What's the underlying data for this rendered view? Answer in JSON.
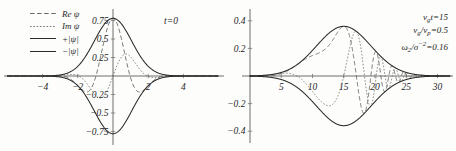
{
  "figure": {
    "background": "#fdfdfc",
    "ink": "#2a2a2a"
  },
  "legend": {
    "items": [
      {
        "label": "Re ψ",
        "style": "long-dash",
        "name": "legend-re-psi"
      },
      {
        "label": "Im ψ",
        "style": "short-dash",
        "name": "legend-im-psi"
      },
      {
        "label": "+|ψ|",
        "style": "solid",
        "name": "legend-plus-abs-psi"
      },
      {
        "label": "−|ψ|",
        "style": "solid",
        "name": "legend-minus-abs-psi"
      }
    ]
  },
  "chart_data": [
    {
      "type": "line",
      "panel": "left",
      "title": "t=0",
      "annotation": "t=0",
      "xlabel": "",
      "ylabel": "",
      "xlim": [
        -5.6,
        5.6
      ],
      "ylim": [
        -0.88,
        0.88
      ],
      "xticks": [
        -4,
        -2,
        2,
        4
      ],
      "xticklabels": [
        "−4",
        "−2",
        "2",
        "4"
      ],
      "yticks": [
        0.75,
        0.5,
        0.25,
        -0.25,
        -0.5,
        -0.75
      ],
      "yticklabels": [
        "0.75",
        "0.5",
        "0.25",
        "−0.25",
        "−0.5",
        "−0.75"
      ],
      "grid": false,
      "legend_position": "upper-left",
      "series": [
        {
          "name": "+|ψ|",
          "style": "solid",
          "peak": 0.78,
          "center": 0.0,
          "width": 1.0
        },
        {
          "name": "−|ψ|",
          "style": "solid",
          "peak": -0.78,
          "center": 0.0,
          "width": 1.0
        },
        {
          "name": "Re ψ",
          "style": "long-dash",
          "peak": 0.78,
          "center": 0.0,
          "width": 1.0,
          "wavenumber": 1.6
        },
        {
          "name": "Im ψ",
          "style": "short-dash",
          "peak": 0.4,
          "center": 0.0,
          "width": 1.0,
          "wavenumber": 1.6
        }
      ]
    },
    {
      "type": "line",
      "panel": "right",
      "title": "",
      "xlabel": "",
      "ylabel": "",
      "xlim": [
        0.0,
        32.0
      ],
      "ylim": [
        -0.47,
        0.47
      ],
      "xticks": [
        5,
        10,
        15,
        20,
        25,
        30
      ],
      "xticklabels": [
        "5",
        "10",
        "15",
        "20",
        "25",
        "30"
      ],
      "yticks": [
        0.4,
        0.2,
        -0.2,
        -0.4
      ],
      "yticklabels": [
        "0.4",
        "0.2",
        "−0.2",
        "−0.4"
      ],
      "grid": false,
      "annotations": [
        {
          "text": "v_g t = 15",
          "html": "v<sub>g</sub>t=15"
        },
        {
          "text": "v_g / v_p = 0.5",
          "html": "v<sub>g</sub>/v<sub>p</sub>=0.5"
        },
        {
          "text": "ω_2 / σ^-2 = 0.16",
          "html": "ω<sub>2</sub>/σ<sup>−2</sup>=0.16"
        }
      ],
      "series": [
        {
          "name": "+|ψ|",
          "style": "solid",
          "peak": 0.36,
          "center": 15.0,
          "width": 4.3
        },
        {
          "name": "−|ψ|",
          "style": "solid",
          "peak": -0.36,
          "center": 15.0,
          "width": 4.3
        },
        {
          "name": "Re ψ",
          "style": "long-dash",
          "peak": 0.36,
          "center": 15.0,
          "width": 4.3,
          "chirp": 0.16
        },
        {
          "name": "Im ψ",
          "style": "short-dash",
          "peak": 0.36,
          "center": 15.0,
          "width": 4.3,
          "chirp": 0.16
        }
      ]
    }
  ]
}
